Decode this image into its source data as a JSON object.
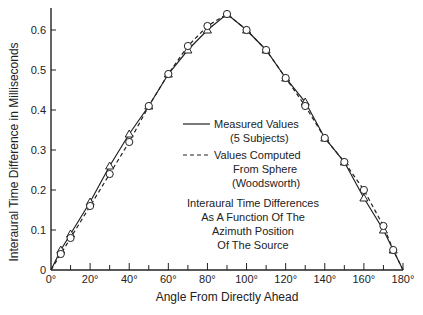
{
  "chart_data": {
    "type": "line",
    "title": "",
    "xlabel": "Angle From Directly Ahead",
    "ylabel": "Interaural Time Difference in Milliseconds",
    "xlim": [
      0,
      180
    ],
    "ylim": [
      0,
      0.65
    ],
    "x_ticks": [
      "0°",
      "20°",
      "40°",
      "60°",
      "80°",
      "100°",
      "120°",
      "140°",
      "160°",
      "180°"
    ],
    "y_ticks": [
      "0",
      "0.1",
      "0.2",
      "0.3",
      "0.4",
      "0.5",
      "0.6"
    ],
    "grid": false,
    "legend": [
      {
        "style": "solid",
        "label": "Measured Values",
        "sublabel": "(5 Subjects)"
      },
      {
        "style": "dashed",
        "label": "Values Computed",
        "sublabel": "From Sphere",
        "sublabel2": "(Woodsworth)"
      }
    ],
    "annotation": [
      "Interaural Time Differences",
      "As A Function Of The",
      "Azimuth Position",
      "Of The Source"
    ],
    "x": [
      0,
      5,
      10,
      20,
      30,
      40,
      50,
      60,
      70,
      80,
      90,
      100,
      110,
      120,
      130,
      140,
      150,
      160,
      170,
      175,
      180
    ],
    "series": [
      {
        "name": "Measured Values (5 Subjects)",
        "marker": "triangle",
        "line": "solid",
        "values": [
          0,
          0.05,
          0.09,
          0.17,
          0.26,
          0.34,
          0.41,
          0.49,
          0.55,
          0.6,
          0.64,
          0.6,
          0.55,
          0.48,
          0.42,
          0.33,
          0.27,
          0.18,
          0.1,
          0.05,
          0
        ]
      },
      {
        "name": "Values Computed From Sphere (Woodsworth)",
        "marker": "circle",
        "line": "dashed",
        "values": [
          0,
          0.04,
          0.08,
          0.16,
          0.24,
          0.32,
          0.41,
          0.49,
          0.56,
          0.61,
          0.64,
          0.6,
          0.55,
          0.48,
          0.41,
          0.33,
          0.27,
          0.2,
          0.11,
          0.05,
          0
        ]
      }
    ]
  }
}
